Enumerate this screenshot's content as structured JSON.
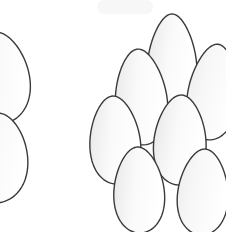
{
  "scene": {
    "title": "Egg Cluster Line Drawing",
    "description": "Black-and-white line art of a pile of eggs with two partial eggs cropped at the left edge",
    "subject": "eggs",
    "egg_count_visible": 9,
    "egg_count_full": 7,
    "egg_count_cropped": 2,
    "style": "outline-illustration",
    "background_color": "#ffffff",
    "stroke_color": "#3a3a3a",
    "stroke_width": 1.4,
    "fill_light": "#ffffff",
    "fill_shade": "#e8e8e8",
    "canvas": {
      "width": 226,
      "height": 232
    }
  },
  "artifact": {
    "name": "top-gray-smudge",
    "color": "#f7f7f7",
    "x": 97,
    "y": 0,
    "width": 56,
    "height": 14,
    "radius": 7
  },
  "eggs": [
    {
      "id": "egg-left-upper-cropped",
      "label": "Upper left cropped egg",
      "group": "left-pair",
      "cx": -2,
      "cy": 78,
      "rx": 36,
      "ry": 46,
      "taper": 0.72,
      "rotation": -4,
      "z": 1,
      "cropped": true
    },
    {
      "id": "egg-left-lower-cropped",
      "label": "Lower left cropped egg",
      "group": "left-pair",
      "cx": -4,
      "cy": 158,
      "rx": 36,
      "ry": 45,
      "taper": 0.74,
      "rotation": 3,
      "z": 2,
      "cropped": true
    },
    {
      "id": "egg-top-center",
      "label": "Top center egg",
      "group": "cluster-top",
      "cx": 172,
      "cy": 63,
      "rx": 29,
      "ry": 49,
      "taper": 0.66,
      "rotation": 0,
      "z": 1,
      "cropped": false
    },
    {
      "id": "egg-upper-right",
      "label": "Upper right egg",
      "group": "cluster-top",
      "cx": 213,
      "cy": 92,
      "rx": 29,
      "ry": 48,
      "taper": 0.68,
      "rotation": 6,
      "z": 2,
      "cropped": true
    },
    {
      "id": "egg-upper-left",
      "label": "Upper left egg of cluster",
      "group": "cluster-middle",
      "cx": 141,
      "cy": 97,
      "rx": 30,
      "ry": 48,
      "taper": 0.68,
      "rotation": -4,
      "z": 3,
      "cropped": false
    },
    {
      "id": "egg-middle-left",
      "label": "Middle left egg",
      "group": "cluster-middle",
      "cx": 115,
      "cy": 140,
      "rx": 29,
      "ry": 44,
      "taper": 0.7,
      "rotation": -3,
      "z": 4,
      "cropped": false
    },
    {
      "id": "egg-middle-right",
      "label": "Middle right egg",
      "group": "cluster-middle",
      "cx": 180,
      "cy": 140,
      "rx": 30,
      "ry": 45,
      "taper": 0.7,
      "rotation": 2,
      "z": 5,
      "cropped": false
    },
    {
      "id": "egg-bottom-center",
      "label": "Bottom center egg",
      "group": "cluster-bottom",
      "cx": 139,
      "cy": 190,
      "rx": 29,
      "ry": 43,
      "taper": 0.7,
      "rotation": -2,
      "z": 6,
      "cropped": false
    },
    {
      "id": "egg-bottom-right",
      "label": "Bottom right egg",
      "group": "cluster-bottom",
      "cx": 203,
      "cy": 192,
      "rx": 29,
      "ry": 43,
      "taper": 0.7,
      "rotation": 3,
      "z": 7,
      "cropped": true
    }
  ]
}
